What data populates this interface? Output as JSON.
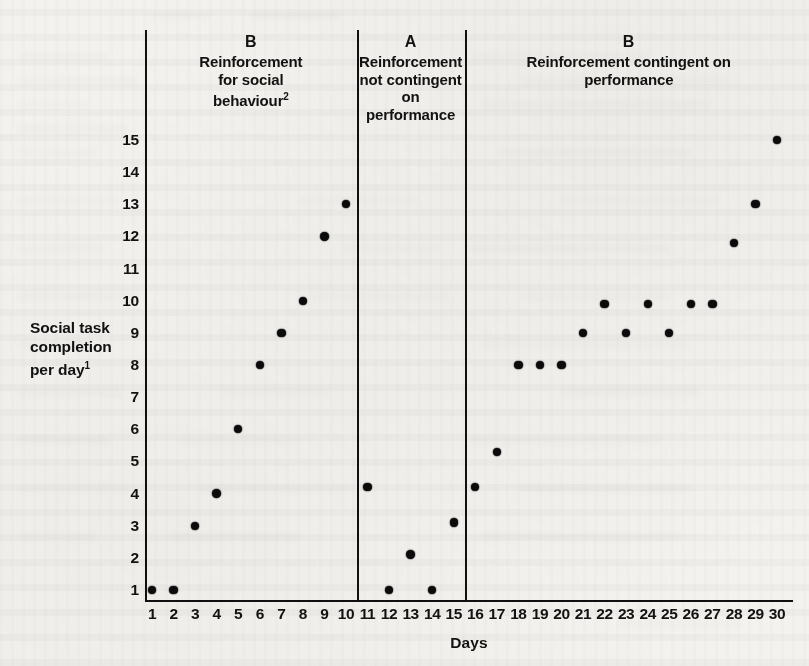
{
  "figure": {
    "y_axis": {
      "title_line1": "Social task",
      "title_line2": "completion",
      "title_line3": "per day",
      "title_footnote": "1",
      "ticks": [
        1,
        2,
        3,
        4,
        5,
        6,
        7,
        8,
        9,
        10,
        11,
        12,
        13,
        14,
        15
      ],
      "min": 1,
      "max": 15
    },
    "x_axis": {
      "title": "Days",
      "ticks": [
        1,
        2,
        3,
        4,
        5,
        6,
        7,
        8,
        9,
        10,
        11,
        12,
        13,
        14,
        15,
        16,
        17,
        18,
        19,
        20,
        21,
        22,
        23,
        24,
        25,
        26,
        27,
        28,
        29,
        30
      ],
      "min": 1,
      "max": 30
    },
    "phases": [
      {
        "letter": "B",
        "description_lines": [
          "Reinforcement",
          "for social",
          "behaviour"
        ],
        "footnote": "2",
        "start_day": 1,
        "end_day": 10
      },
      {
        "letter": "A",
        "description_lines": [
          "Reinforcement",
          "not contingent",
          "on performance"
        ],
        "footnote": "",
        "start_day": 11,
        "end_day": 15
      },
      {
        "letter": "B",
        "description_lines": [
          "Reinforcement contingent on",
          "performance"
        ],
        "footnote": "",
        "start_day": 16,
        "end_day": 30
      }
    ],
    "colors": {
      "ink": "#0b0b0b",
      "paper": "#f3f2ef"
    }
  },
  "chart_data": {
    "type": "scatter",
    "title": "",
    "xlabel": "Days",
    "ylabel": "Social task completion per day",
    "xlim": [
      1,
      30
    ],
    "ylim": [
      1,
      15
    ],
    "grid": false,
    "legend": "none",
    "x": [
      1,
      2,
      3,
      4,
      5,
      6,
      7,
      8,
      9,
      10,
      11,
      12,
      13,
      14,
      15,
      16,
      17,
      18,
      19,
      20,
      21,
      22,
      23,
      24,
      25,
      26,
      27,
      28,
      29,
      30
    ],
    "values": [
      1,
      1,
      3,
      4,
      6,
      8,
      9,
      10,
      12,
      13,
      4.2,
      1,
      2.1,
      1,
      3.1,
      4.2,
      5.3,
      8,
      8,
      8,
      9,
      9.9,
      9,
      9.9,
      9,
      9.9,
      9.9,
      11.8,
      13,
      15
    ],
    "series": [
      {
        "name": "Social task completion per day",
        "points": [
          {
            "day": 1,
            "value": 1,
            "phase": "B"
          },
          {
            "day": 2,
            "value": 1,
            "phase": "B"
          },
          {
            "day": 3,
            "value": 3,
            "phase": "B"
          },
          {
            "day": 4,
            "value": 4,
            "phase": "B"
          },
          {
            "day": 5,
            "value": 6,
            "phase": "B"
          },
          {
            "day": 6,
            "value": 8,
            "phase": "B"
          },
          {
            "day": 7,
            "value": 9,
            "phase": "B"
          },
          {
            "day": 8,
            "value": 10,
            "phase": "B"
          },
          {
            "day": 9,
            "value": 12,
            "phase": "B"
          },
          {
            "day": 10,
            "value": 13,
            "phase": "B"
          },
          {
            "day": 11,
            "value": 4.2,
            "phase": "A"
          },
          {
            "day": 12,
            "value": 1,
            "phase": "A"
          },
          {
            "day": 13,
            "value": 2.1,
            "phase": "A"
          },
          {
            "day": 14,
            "value": 1,
            "phase": "A"
          },
          {
            "day": 15,
            "value": 3.1,
            "phase": "A"
          },
          {
            "day": 16,
            "value": 4.2,
            "phase": "B2"
          },
          {
            "day": 17,
            "value": 5.3,
            "phase": "B2"
          },
          {
            "day": 18,
            "value": 8,
            "phase": "B2"
          },
          {
            "day": 19,
            "value": 8,
            "phase": "B2"
          },
          {
            "day": 20,
            "value": 8,
            "phase": "B2"
          },
          {
            "day": 21,
            "value": 9,
            "phase": "B2"
          },
          {
            "day": 22,
            "value": 9.9,
            "phase": "B2"
          },
          {
            "day": 23,
            "value": 9,
            "phase": "B2"
          },
          {
            "day": 24,
            "value": 9.9,
            "phase": "B2"
          },
          {
            "day": 25,
            "value": 9,
            "phase": "B2"
          },
          {
            "day": 26,
            "value": 9.9,
            "phase": "B2"
          },
          {
            "day": 27,
            "value": 9.9,
            "phase": "B2"
          },
          {
            "day": 28,
            "value": 11.8,
            "phase": "B2"
          },
          {
            "day": 29,
            "value": 13,
            "phase": "B2"
          },
          {
            "day": 30,
            "value": 15,
            "phase": "B2"
          }
        ]
      }
    ],
    "annotations": [
      {
        "text": "B",
        "kind": "phase-label",
        "span_days": [
          1,
          10
        ]
      },
      {
        "text": "A",
        "kind": "phase-label",
        "span_days": [
          11,
          15
        ]
      },
      {
        "text": "B",
        "kind": "phase-label",
        "span_days": [
          16,
          30
        ]
      }
    ],
    "phase_divider_days": [
      10.5,
      15.5
    ]
  }
}
